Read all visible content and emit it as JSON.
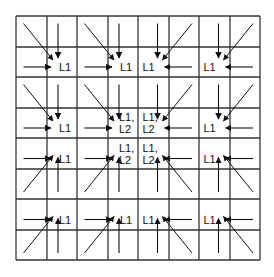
{
  "diagram": {
    "type": "grid-aggregation",
    "grid": {
      "rows": 8,
      "cols": 8,
      "block_size": 2,
      "lines": [
        16,
        47,
        77,
        108,
        138,
        169,
        199,
        230,
        260
      ],
      "line_color": "#333333"
    },
    "arrow_color": "#111111",
    "blocks": [
      {
        "row": 0,
        "col": 0,
        "label": [
          "L1"
        ]
      },
      {
        "row": 0,
        "col": 1,
        "label": [
          "L1"
        ]
      },
      {
        "row": 0,
        "col": 2,
        "label": [
          "L1"
        ]
      },
      {
        "row": 0,
        "col": 3,
        "label": [
          "L1"
        ]
      },
      {
        "row": 1,
        "col": 0,
        "label": [
          "L1"
        ]
      },
      {
        "row": 1,
        "col": 1,
        "label": [
          "L1,",
          "L2"
        ]
      },
      {
        "row": 1,
        "col": 2,
        "label": [
          "L1,",
          "L2"
        ]
      },
      {
        "row": 1,
        "col": 3,
        "label": [
          "L1"
        ]
      },
      {
        "row": 2,
        "col": 0,
        "label": [
          "L1"
        ]
      },
      {
        "row": 2,
        "col": 1,
        "label": [
          "L1,",
          "L2"
        ]
      },
      {
        "row": 2,
        "col": 2,
        "label": [
          "L1,",
          "L2"
        ]
      },
      {
        "row": 2,
        "col": 3,
        "label": [
          "L1"
        ]
      },
      {
        "row": 3,
        "col": 0,
        "label": [
          "L1"
        ]
      },
      {
        "row": 3,
        "col": 1,
        "label": [
          "L1"
        ]
      },
      {
        "row": 3,
        "col": 2,
        "label": [
          "L1"
        ]
      },
      {
        "row": 3,
        "col": 3,
        "label": [
          "L1"
        ]
      }
    ]
  }
}
